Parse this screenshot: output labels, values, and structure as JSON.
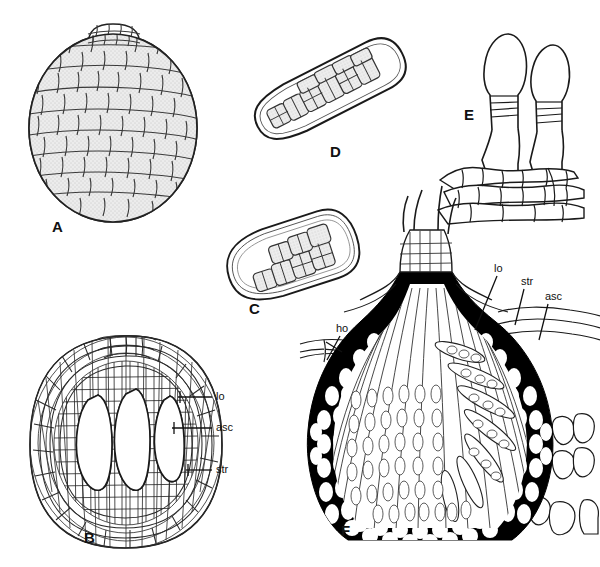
{
  "figure": {
    "background_color": "#ffffff",
    "ink_color": "#111111",
    "cell_fill_color": "#e9e9e9",
    "wall_dark_color": "#000000",
    "lumen_color": "#ffffff",
    "panels": [
      {
        "id": "A",
        "letter": "A",
        "subject": "ascoma-surface-view",
        "x": 52,
        "y": 232
      },
      {
        "id": "B",
        "letter": "B",
        "subject": "ascoma-vertical-section-multiloculate",
        "x": 84,
        "y": 543
      },
      {
        "id": "C",
        "letter": "C",
        "subject": "ascus-short-with-ascospores",
        "x": 249,
        "y": 314
      },
      {
        "id": "D",
        "letter": "D",
        "subject": "ascus-elongate-with-ascospores",
        "x": 330,
        "y": 157
      },
      {
        "id": "E",
        "letter": "E",
        "subject": "asci-emerging-from-hymenium",
        "x": 464,
        "y": 120
      },
      {
        "id": "F",
        "letter": "F",
        "subject": "ascostroma-vertical-section-carbonaceous",
        "x": 341,
        "y": 536
      }
    ],
    "annotations": [
      {
        "panel": "B",
        "text": "lo",
        "text_x": 216,
        "text_y": 400,
        "leader": {
          "x1": 212,
          "y1": 397,
          "x2": 178,
          "y2": 397
        }
      },
      {
        "panel": "B",
        "text": "asc",
        "text_x": 216,
        "text_y": 431,
        "leader": {
          "x1": 212,
          "y1": 428,
          "x2": 172,
          "y2": 428
        }
      },
      {
        "panel": "B",
        "text": "str",
        "text_x": 216,
        "text_y": 473,
        "leader": {
          "x1": 212,
          "y1": 470,
          "x2": 186,
          "y2": 470
        }
      },
      {
        "panel": "F",
        "text": "ho",
        "text_x": 336,
        "text_y": 332,
        "leader": {
          "x1": 340,
          "y1": 336,
          "x2": 327,
          "y2": 360
        }
      },
      {
        "panel": "F",
        "text": "lo",
        "text_x": 494,
        "text_y": 272,
        "leader": {
          "x1": 497,
          "y1": 276,
          "x2": 475,
          "y2": 330
        }
      },
      {
        "panel": "F",
        "text": "str",
        "text_x": 521,
        "text_y": 285,
        "leader": {
          "x1": 524,
          "y1": 289,
          "x2": 515,
          "y2": 325
        }
      },
      {
        "panel": "F",
        "text": "asc",
        "text_x": 545,
        "text_y": 300,
        "leader": {
          "x1": 548,
          "y1": 304,
          "x2": 539,
          "y2": 340
        }
      }
    ],
    "annotation_glossary": [
      {
        "abbrev": "lo",
        "meaning": "locule"
      },
      {
        "abbrev": "asc",
        "meaning": "ascus"
      },
      {
        "abbrev": "str",
        "meaning": "stroma"
      },
      {
        "abbrev": "ho",
        "meaning": "host tissue"
      }
    ]
  }
}
